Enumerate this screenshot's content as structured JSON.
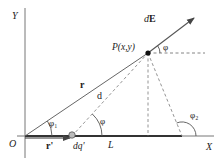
{
  "diagram": {
    "title": "",
    "axes": {
      "x_label": "X",
      "y_label": "Y",
      "origin_label": "O"
    },
    "point": {
      "label": "P(x,y)"
    },
    "vectors": {
      "r_label": "r",
      "r_prime_label": "r'",
      "dE_label": "dE"
    },
    "segments": {
      "d_label": "d",
      "L_label": "L"
    },
    "charge": {
      "dq_label": "dq'"
    },
    "angles": {
      "phi_at_P": "φ",
      "phi_at_dq": "φ",
      "phi_1": "φ₁",
      "phi_2": "φ₂"
    },
    "colors": {
      "line": "#555555",
      "dashed": "#777777",
      "text": "#222222",
      "charge_line": "#333333"
    }
  }
}
